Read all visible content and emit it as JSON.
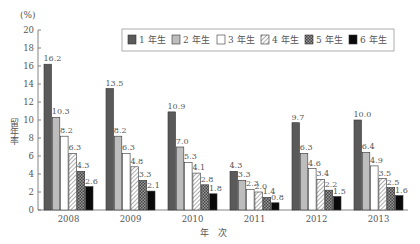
{
  "chart_data": {
    "type": "bar",
    "title": "",
    "unit_label": "(%)",
    "xlabel": "年　次",
    "ylabel": "留年率",
    "ylim": [
      0,
      20
    ],
    "yticks": [
      0,
      2,
      4,
      6,
      8,
      10,
      12,
      14,
      16,
      18,
      20
    ],
    "grid": false,
    "legend_position": "top-right",
    "categories": [
      "2008",
      "2009",
      "2010",
      "2011",
      "2012",
      "2013"
    ],
    "series": [
      {
        "name": "1年生",
        "pattern": "dark",
        "values": [
          16.2,
          13.5,
          10.9,
          4.3,
          9.7,
          10.0
        ]
      },
      {
        "name": "2年生",
        "pattern": "light-gray",
        "values": [
          10.3,
          8.2,
          7.0,
          3.3,
          6.3,
          6.4
        ]
      },
      {
        "name": "3年生",
        "pattern": "white",
        "values": [
          8.2,
          6.3,
          5.3,
          2.3,
          4.6,
          4.9
        ]
      },
      {
        "name": "4年生",
        "pattern": "diagonal-hatch",
        "values": [
          6.3,
          4.8,
          4.1,
          2.0,
          3.4,
          3.5
        ]
      },
      {
        "name": "5年生",
        "pattern": "crosshatch",
        "values": [
          4.3,
          3.3,
          2.8,
          1.4,
          2.2,
          2.5
        ]
      },
      {
        "name": "6年生",
        "pattern": "black",
        "values": [
          2.6,
          2.1,
          1.8,
          0.8,
          1.5,
          1.6
        ]
      }
    ],
    "value_labels": [
      [
        "16.2",
        "10.3",
        "8.2",
        "6.3",
        "4.3",
        "2.6"
      ],
      [
        "13.5",
        "8.2",
        "6.3",
        "4.8",
        "3.3",
        "2.1"
      ],
      [
        "10.9",
        "7.0",
        "5.3",
        "4.1",
        "2.8",
        "1.8"
      ],
      [
        "4.3",
        "3.3",
        "2.3",
        "2.0",
        "1.4",
        "0.8"
      ],
      [
        "9.7",
        "6.3",
        "4.6",
        "3.4",
        "2.2",
        "1.5"
      ],
      [
        "10.0",
        "6.4",
        "4.9",
        "3.5",
        "2.5",
        "1.6"
      ]
    ]
  },
  "colors": {
    "dark": "#5a5a5a",
    "light_gray": "#bdbdbd",
    "white": "#ffffff",
    "black": "#0a0a0a",
    "axis": "#666666",
    "text": "#555555"
  }
}
